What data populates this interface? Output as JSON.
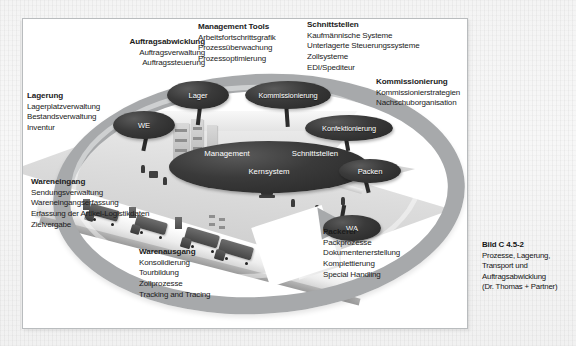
{
  "figure": {
    "caption": {
      "label": "Bild C 4.5-2",
      "lines": [
        "Prozesse, Lagerung,",
        "Transport und",
        "Auftragsabwicklung",
        "(Dr. Thomas + Partner)"
      ]
    },
    "colors": {
      "page_background": "#f4f4f4",
      "frame_background": "#ffffff",
      "ring_gray": "#a7a9ab",
      "ellipse_dark": "#2b2b2b",
      "text": "#1b1b1b"
    },
    "illustration": {
      "name": "isometric-warehouse-illustration",
      "description": "Grayscale isometric drawing of a warehouse with loading dock, trucks, racking, forklifts and workers"
    },
    "ellipses": [
      {
        "id": "lager",
        "label": "Lager"
      },
      {
        "id": "kommissionierung",
        "label": "Kommissionierung"
      },
      {
        "id": "we",
        "label": "WE"
      },
      {
        "id": "konfektionierung",
        "label": "Konfektionierung"
      },
      {
        "id": "packen",
        "label": "Packen"
      },
      {
        "id": "wa",
        "label": "WA"
      },
      {
        "id": "management",
        "label": "Management"
      },
      {
        "id": "schnittstellen",
        "label": "Schnittstellen"
      },
      {
        "id": "kernsystem",
        "label": "Kernsystem"
      }
    ],
    "blocks": [
      {
        "id": "lagerung",
        "heading": "Lagerung",
        "items": [
          "Lagerplatzverwaltung",
          "Bestandsverwaltung",
          "Inventur"
        ]
      },
      {
        "id": "auftragsabwicklung",
        "heading": "Auftragsabwicklung",
        "items": [
          "Auftragsverwaltung",
          "Auftragssteuerung"
        ]
      },
      {
        "id": "management-tools",
        "heading": "Management Tools",
        "items": [
          "Arbeitsfortschrittsgrafik",
          "Prozessüberwachung",
          "Prozessoptimierung"
        ]
      },
      {
        "id": "schnittstellen",
        "heading": "Schnittstellen",
        "items": [
          "Kaufmännische Systeme",
          "Unterlagerte Steuerungssysteme",
          "Zollsysteme",
          "EDI/Spediteur"
        ]
      },
      {
        "id": "kommissionierung",
        "heading": "Kommissionierung",
        "items": [
          "Kommissionierstrategien",
          "Nachschuborganisation"
        ]
      },
      {
        "id": "wareneingang",
        "heading": "Wareneingang",
        "items": [
          "Sendungsverwaltung",
          "Wareneingangserfassung",
          "Erfassung der Artikel-Logistikdaten",
          "Zielvergabe"
        ]
      },
      {
        "id": "warenausgang",
        "heading": "Warenausgang",
        "items": [
          "Konsolidierung",
          "Tourbildung",
          "Zollprozesse",
          "Tracking and Tracing"
        ]
      },
      {
        "id": "packerei",
        "heading": "Packerei",
        "items": [
          "Packprozesse",
          "Dokumentenerstellung",
          "Komplettierung",
          "Special Handling"
        ]
      }
    ]
  }
}
